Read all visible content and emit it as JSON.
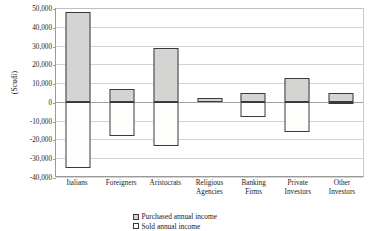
{
  "chart_data": {
    "type": "bar",
    "title": "",
    "xlabel": "",
    "ylabel": "(Scudi)",
    "ylim": [
      -40000,
      50000
    ],
    "ytick_step": 10000,
    "grid": true,
    "stacked_around_zero": true,
    "legend_position": "bottom-center",
    "categories": [
      "Italians",
      "Foreigners",
      "Aristocrats",
      "Religious Agencies",
      "Banking Firms",
      "Private Investors",
      "Other Investors"
    ],
    "category_lines": [
      [
        "Italians"
      ],
      [
        "Foreigners"
      ],
      [
        "Aristocrats"
      ],
      [
        "Religious",
        "Agencies"
      ],
      [
        "Banking",
        "Firms"
      ],
      [
        "Private",
        "Investors"
      ],
      [
        "Other",
        "Investors"
      ]
    ],
    "ytick_labels": [
      "50,000",
      "40,000",
      "30,000",
      "20,000",
      "10,000",
      "0",
      "-10,000",
      "-20,000",
      "-30,000",
      "-40,000"
    ],
    "ytick_values": [
      50000,
      40000,
      30000,
      20000,
      10000,
      0,
      -10000,
      -20000,
      -30000,
      -40000
    ],
    "series": [
      {
        "name": "Purchased annual income",
        "color": "#d4d4d2",
        "values": [
          48000,
          7000,
          28500,
          2000,
          5000,
          12500,
          5000
        ]
      },
      {
        "name": "Sold annual income",
        "color": "#fdfdfc",
        "values": [
          -35000,
          -18000,
          -23500,
          0,
          -8000,
          -16000,
          -1000
        ]
      }
    ]
  },
  "legend": {
    "items": [
      {
        "label": "Purchased annual income",
        "swatch": "purchased"
      },
      {
        "label": "Sold annual income",
        "swatch": "sold"
      }
    ]
  },
  "axis": {
    "y_title": "(Scudi)"
  },
  "colors": {
    "purchased_fill": "#d4d4d2",
    "sold_fill": "#fdfdfc",
    "bar_outline": "#3a3a3a",
    "gridline": "#d3d3d3",
    "axis_line": "#9a9a9a",
    "text": "#1a1a1a"
  }
}
